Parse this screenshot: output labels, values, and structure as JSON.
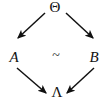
{
  "figure": {
    "type": "commutative-diagram",
    "shape": "diamond",
    "background_color": "#ffffff",
    "ink_color": "#111111",
    "width": 110,
    "height": 106
  },
  "nodes": {
    "top": {
      "label": "Θ",
      "name": "Theta",
      "position": "top",
      "x": 55,
      "y": 8
    },
    "left": {
      "label": "A",
      "name": "A",
      "position": "left",
      "x": 14,
      "y": 57
    },
    "right": {
      "label": "B",
      "name": "B",
      "position": "right",
      "x": 94,
      "y": 57
    },
    "bottom": {
      "label": "Λ",
      "name": "Lambda",
      "position": "bottom",
      "x": 57,
      "y": 92
    }
  },
  "center": {
    "label": "~",
    "name": "tilde"
  },
  "arrows": [
    {
      "id": "theta-to-a",
      "from": "Θ",
      "to": "A",
      "label": "",
      "x1": 45,
      "y1": 13,
      "x2": 18,
      "y2": 38
    },
    {
      "id": "theta-to-b",
      "from": "Θ",
      "to": "B",
      "label": "",
      "x1": 66,
      "y1": 13,
      "x2": 93,
      "y2": 38
    },
    {
      "id": "a-to-lambda",
      "from": "A",
      "to": "Λ",
      "label": "",
      "x1": 17,
      "y1": 68,
      "x2": 46,
      "y2": 93
    },
    {
      "id": "b-to-lambda",
      "from": "B",
      "to": "Λ",
      "label": "",
      "x1": 94,
      "y1": 68,
      "x2": 67,
      "y2": 93
    }
  ]
}
